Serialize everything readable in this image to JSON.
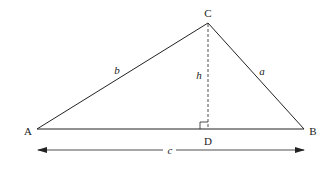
{
  "diagram": {
    "type": "triangle-with-altitude",
    "vertices": {
      "A": {
        "label": "A",
        "x": 37,
        "y": 129
      },
      "B": {
        "label": "B",
        "x": 304,
        "y": 129
      },
      "C": {
        "label": "C",
        "x": 208,
        "y": 23
      },
      "D": {
        "label": "D",
        "x": 208,
        "y": 129
      }
    },
    "sides": {
      "a": {
        "label": "a",
        "from": "C",
        "to": "B"
      },
      "b": {
        "label": "b",
        "from": "A",
        "to": "C"
      },
      "c": {
        "label": "c",
        "from": "A",
        "to": "B"
      },
      "h": {
        "label": "h",
        "from": "C",
        "to": "D",
        "style": "dashed"
      }
    },
    "right_angle_at": "D",
    "dimension_arrow": {
      "label": "c",
      "from_x": 38,
      "to_x": 304,
      "y": 150
    },
    "colors": {
      "stroke": "#222222",
      "background": "#ffffff"
    }
  }
}
